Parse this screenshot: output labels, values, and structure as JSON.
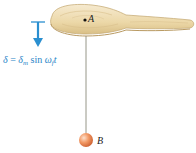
{
  "figure": {
    "labels": {
      "point_a": "A",
      "point_b": "B"
    },
    "formula": {
      "lhs": "δ",
      "equals": " = ",
      "amplitude": "δ",
      "amplitude_sub": "m",
      "function": " sin ",
      "omega": "ω",
      "omega_sub": "f",
      "time": "t"
    },
    "colors": {
      "arrow": "#2a8fd0",
      "formula": "#2a86c8",
      "paddle_wood": "#eedcb0",
      "paddle_edge": "#c8ad78",
      "string": "#8a8a7a",
      "ball": "#e8824f"
    }
  }
}
